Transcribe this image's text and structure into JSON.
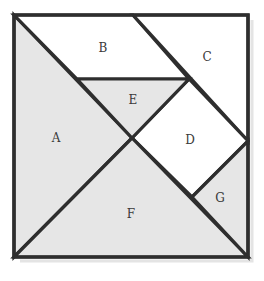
{
  "diagram": {
    "type": "tangram-square",
    "colors": {
      "shaded": "#e6e6e6",
      "unshaded": "#ffffff",
      "stroke": "#2e2e2e",
      "label": "#3a3a3a"
    },
    "pieces": [
      {
        "id": "A",
        "label": "A",
        "shaded": true,
        "shape": "large triangle",
        "points": "14,15 132,138 14,257",
        "label_pos": [
          56,
          138
        ]
      },
      {
        "id": "B",
        "label": "B",
        "shaded": false,
        "shape": "parallelogram",
        "points": "14,15 133,15 189,79 77,79",
        "label_pos": [
          103,
          48
        ]
      },
      {
        "id": "C",
        "label": "C",
        "shaded": false,
        "shape": "medium triangle",
        "points": "133,15 248,15 248,141",
        "label_pos": [
          207,
          57
        ]
      },
      {
        "id": "D",
        "label": "D",
        "shaded": false,
        "shape": "square",
        "points": "189,79 248,141 192,197 132,138",
        "label_pos": [
          190,
          140
        ]
      },
      {
        "id": "E",
        "label": "E",
        "shaded": true,
        "shape": "small triangle",
        "points": "77,79 189,79 132,138",
        "label_pos": [
          133,
          100
        ]
      },
      {
        "id": "F",
        "label": "F",
        "shaded": true,
        "shape": "large triangle",
        "points": "14,257 132,138 248,257",
        "label_pos": [
          131,
          214
        ]
      },
      {
        "id": "G",
        "label": "G",
        "shaded": true,
        "shape": "small triangle",
        "points": "248,141 248,257 192,197",
        "label_pos": [
          220,
          198
        ]
      }
    ]
  }
}
